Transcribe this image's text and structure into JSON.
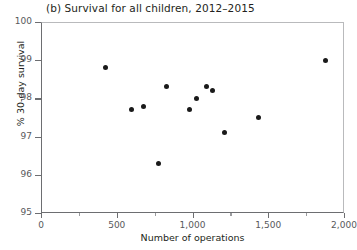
{
  "chart_data": {
    "type": "scatter",
    "title": "(b) Survival for all children, 2012–2015",
    "xlabel": "Number of operations",
    "ylabel": "% 30-day survival",
    "xlim": [
      0,
      2000
    ],
    "ylim": [
      95,
      100
    ],
    "grid": false,
    "legend": null,
    "marker": {
      "shape": "circle",
      "color": "#1a1a1a",
      "size": 5
    },
    "xticks": [
      0,
      500,
      1000,
      1500,
      2000
    ],
    "xtick_labels": [
      "0",
      "500",
      "1,000",
      "1,500",
      "2,000"
    ],
    "xticks_minor": [
      250,
      750,
      1250,
      1750
    ],
    "yticks": [
      95,
      96,
      97,
      98,
      99,
      100
    ],
    "ytick_labels": [
      "95",
      "96",
      "97",
      "98",
      "99",
      "100"
    ],
    "points": [
      {
        "x": 425,
        "y": 98.8
      },
      {
        "x": 595,
        "y": 97.7
      },
      {
        "x": 675,
        "y": 97.8
      },
      {
        "x": 775,
        "y": 96.3
      },
      {
        "x": 830,
        "y": 98.3
      },
      {
        "x": 980,
        "y": 97.7
      },
      {
        "x": 1025,
        "y": 98.0
      },
      {
        "x": 1090,
        "y": 98.3
      },
      {
        "x": 1130,
        "y": 98.2
      },
      {
        "x": 1210,
        "y": 97.1
      },
      {
        "x": 1435,
        "y": 97.5
      },
      {
        "x": 1880,
        "y": 99.0
      }
    ]
  }
}
